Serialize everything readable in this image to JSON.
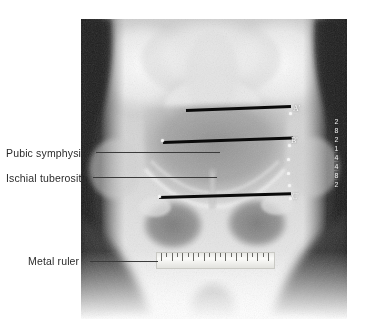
{
  "figure": {
    "type": "annotated-radiograph",
    "modality": "x-ray",
    "region": "pelvis",
    "view": "anteroposterior"
  },
  "annotations": [
    {
      "id": "pubic-symphysis",
      "label": "Pubic symphysis",
      "leader_line": true
    },
    {
      "id": "ischial-tuberosity",
      "label": "Ischial tuberosity",
      "leader_line": true
    },
    {
      "id": "metal-ruler",
      "label": "Metal ruler",
      "leader_line": true
    }
  ],
  "landmarks": [
    {
      "id": "a-prime",
      "label": "A'"
    },
    {
      "id": "b-prime",
      "label": "B'"
    },
    {
      "id": "c-prime",
      "label": "C'"
    }
  ],
  "measurement_lines": [
    {
      "id": "line-a",
      "landmark": "A'"
    },
    {
      "id": "line-b",
      "landmark": "B'"
    },
    {
      "id": "line-c",
      "landmark": "C'"
    }
  ],
  "ruler": {
    "name": "metal-ruler",
    "major_tick_count": 11,
    "minor_tick_count": 12
  },
  "film_id_marks": [
    "2",
    "8",
    "2",
    "1",
    "4",
    "4",
    "8",
    "2"
  ],
  "colors": {
    "background": "#ffffff",
    "label_text": "#2b2b2b",
    "leader_line": "#3a3a3a",
    "measurement_line": "#0a0a0a",
    "landmark_text": "#fafafa",
    "ruler_body": "#f1f1ee",
    "ruler_tick": "#6a6a66"
  }
}
